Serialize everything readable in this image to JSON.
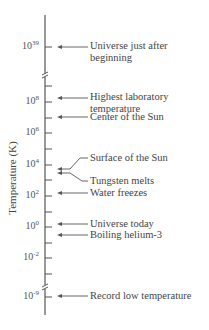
{
  "diagram": {
    "title": "",
    "y_axis_label": "Temperature (K)",
    "axis": {
      "x": 45,
      "top": 15,
      "bottom": 315,
      "color": "#555555",
      "breaks_y": [
        75,
        287
      ]
    },
    "ticks": [
      {
        "y": 47,
        "base": "10",
        "exp": "39",
        "labeled": true
      },
      {
        "y": 86,
        "labeled": false
      },
      {
        "y": 102,
        "base": "10",
        "exp": "8",
        "labeled": true
      },
      {
        "y": 118,
        "labeled": false
      },
      {
        "y": 133,
        "base": "10",
        "exp": "6",
        "labeled": true
      },
      {
        "y": 149,
        "labeled": false
      },
      {
        "y": 165,
        "base": "10",
        "exp": "4",
        "labeled": true
      },
      {
        "y": 180,
        "labeled": false
      },
      {
        "y": 196,
        "base": "10",
        "exp": "2",
        "labeled": true
      },
      {
        "y": 212,
        "labeled": false
      },
      {
        "y": 227,
        "base": "10",
        "exp": "0",
        "labeled": true
      },
      {
        "y": 243,
        "labeled": false
      },
      {
        "y": 258,
        "base": "10",
        "exp": "-2",
        "labeled": true
      },
      {
        "y": 274,
        "labeled": false
      },
      {
        "y": 297,
        "base": "10",
        "exp": "-9",
        "labeled": true
      }
    ],
    "events": [
      {
        "id": "universe-just-after-beginning",
        "lines": [
          "Universe just after",
          "beginning"
        ],
        "arrow_y": 47,
        "text_y": 40,
        "style": "straight"
      },
      {
        "id": "highest-laboratory-temperature",
        "lines": [
          "Highest laboratory",
          "temperature"
        ],
        "arrow_y": 98,
        "text_y": 91,
        "style": "straight"
      },
      {
        "id": "center-of-the-sun",
        "lines": [
          "Center of the Sun"
        ],
        "arrow_y": 117,
        "text_y": 111,
        "style": "straight"
      },
      {
        "id": "surface-of-the-sun",
        "lines": [
          "Surface of the Sun"
        ],
        "arrow_y": 169,
        "text_y": 152,
        "style": "bent-up"
      },
      {
        "id": "tungsten-melts",
        "lines": [
          "Tungsten melts"
        ],
        "arrow_y": 173,
        "text_y": 175,
        "style": "bent-down"
      },
      {
        "id": "water-freezes",
        "lines": [
          "Water freezes"
        ],
        "arrow_y": 193,
        "text_y": 187,
        "style": "straight"
      },
      {
        "id": "universe-today",
        "lines": [
          "Universe today"
        ],
        "arrow_y": 224,
        "text_y": 218,
        "style": "straight"
      },
      {
        "id": "boiling-helium-3",
        "lines": [
          "Boiling helium-3"
        ],
        "arrow_y": 235,
        "text_y": 229,
        "style": "straight"
      },
      {
        "id": "record-low-temperature",
        "lines": [
          "Record low temperature"
        ],
        "arrow_y": 296,
        "text_y": 290,
        "style": "straight"
      }
    ]
  }
}
